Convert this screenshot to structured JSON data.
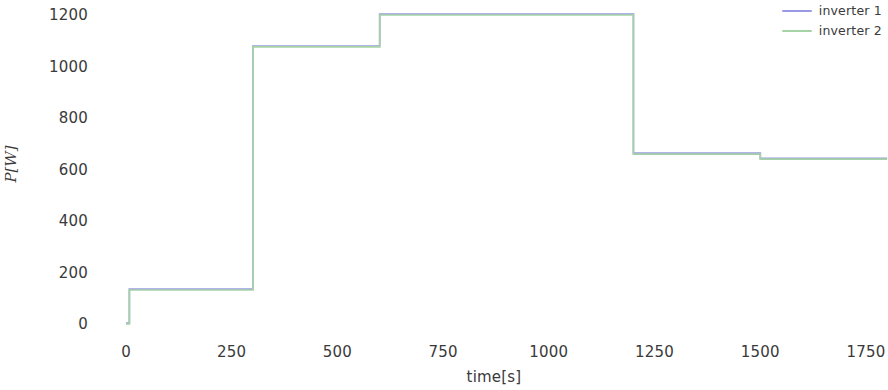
{
  "chart_data": {
    "type": "line",
    "title": "",
    "xlabel": "time[s]",
    "ylabel": "P[W]",
    "xlim": [
      -60,
      1810
    ],
    "ylim": [
      -45,
      1255
    ],
    "xticks": [
      0,
      250,
      500,
      750,
      1000,
      1250,
      1500,
      1750
    ],
    "xticklabels": [
      "0",
      "250",
      "500",
      "750",
      "1000",
      "1250",
      "1500",
      "1750"
    ],
    "yticks": [
      0,
      200,
      400,
      600,
      800,
      1000,
      1200
    ],
    "yticklabels": [
      "0",
      "200",
      "400",
      "600",
      "800",
      "1000",
      "1200"
    ],
    "grid": false,
    "legend_position": "top-right",
    "drawstyle": "steps-post",
    "series": [
      {
        "name": "inverter 1",
        "color": "#9a9ae4",
        "x": [
          0,
          8,
          300,
          600,
          1200,
          1500,
          1800
        ],
        "y": [
          0,
          132,
          1076,
          1200,
          660,
          640,
          640
        ]
      },
      {
        "name": "inverter 2",
        "color": "#a5d3a5",
        "x": [
          0,
          8,
          300,
          600,
          1200,
          1500,
          1800
        ],
        "y": [
          0,
          132,
          1076,
          1200,
          660,
          640,
          640
        ]
      }
    ],
    "annotations": []
  },
  "legend": {
    "entries": [
      {
        "label": "inverter 1",
        "color": "#9a9ae4"
      },
      {
        "label": "inverter 2",
        "color": "#a5d3a5"
      }
    ]
  }
}
